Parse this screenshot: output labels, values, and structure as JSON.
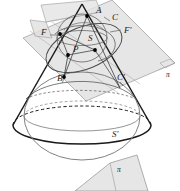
{
  "figure": {
    "type": "geometry-diagram",
    "canvas": {
      "width": 180,
      "height": 191
    },
    "colors": {
      "stroke_dark": "#1a1a1a",
      "stroke_mid": "#585858",
      "stroke_light": "#8a8a8a",
      "plane_fill": "#dcdcdc",
      "plane_fill_light": "#e8e8e8",
      "plane_stroke": "#9a9a9a",
      "background": "#ffffff",
      "point_fill": "#000000"
    },
    "labels": [
      {
        "id": "A",
        "text": "A",
        "x": 96,
        "y": 13,
        "size": "normal"
      },
      {
        "id": "C",
        "text": "C",
        "x": 112,
        "y": 20,
        "size": "normal"
      },
      {
        "id": "F",
        "text": "F",
        "x": 41,
        "y": 35,
        "size": "normal"
      },
      {
        "id": "Fp",
        "text": "F'",
        "x": 124,
        "y": 33,
        "size": "normal"
      },
      {
        "id": "S",
        "text": "S",
        "x": 88,
        "y": 41,
        "size": "normal"
      },
      {
        "id": "P",
        "text": "P",
        "x": 73,
        "y": 52,
        "size": "normal"
      },
      {
        "id": "B",
        "text": "B",
        "x": 57,
        "y": 81,
        "size": "normal"
      },
      {
        "id": "Cp",
        "text": "C'",
        "x": 117,
        "y": 80,
        "size": "normal"
      },
      {
        "id": "Sp",
        "text": "S'",
        "x": 112,
        "y": 137,
        "size": "normal"
      },
      {
        "id": "pi_top",
        "text": "π",
        "x": 166,
        "y": 77,
        "size": "small"
      },
      {
        "id": "pi_bottom",
        "text": "π",
        "x": 117,
        "y": 172,
        "size": "small"
      }
    ],
    "points": [
      {
        "id": "point-A",
        "x": 87,
        "y": 16
      },
      {
        "id": "point-F",
        "x": 60,
        "y": 34
      },
      {
        "id": "point-P",
        "x": 68,
        "y": 55
      },
      {
        "id": "point-Fprime",
        "x": 95,
        "y": 50
      },
      {
        "id": "point-B",
        "x": 64,
        "y": 77
      },
      {
        "id": "point-apex",
        "x": 82,
        "y": 4
      }
    ],
    "elements": [
      {
        "id": "cone",
        "name": "cone-outline"
      },
      {
        "id": "sphere-upper",
        "name": "inscribed-sphere-upper"
      },
      {
        "id": "sphere-lower",
        "name": "inscribed-sphere-lower"
      },
      {
        "id": "cutting-plane",
        "name": "cutting-plane-pi"
      },
      {
        "id": "conic-section",
        "name": "conic-section-ellipse"
      },
      {
        "id": "detached-plane",
        "name": "detached-plane-pi"
      },
      {
        "id": "base-circle",
        "name": "cone-base-circle"
      },
      {
        "id": "tangency-circle",
        "name": "sphere-tangency-circle"
      }
    ]
  }
}
